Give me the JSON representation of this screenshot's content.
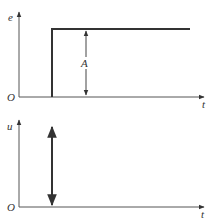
{
  "top_plot": {
    "y_label": "e",
    "x_label": "t",
    "origin_label": "O",
    "amplitude_label": "A",
    "description": "step input of amplitude A"
  },
  "bottom_plot": {
    "y_label": "u",
    "x_label": "t",
    "origin_label": "O",
    "description": "impulse output"
  },
  "colors": {
    "axis": "#555555",
    "signal": "#333333",
    "background": "#ffffff"
  }
}
